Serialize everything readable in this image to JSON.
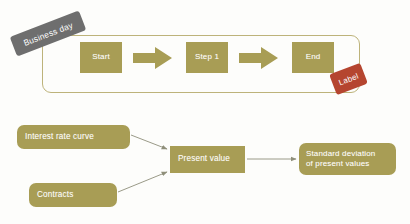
{
  "diagram": {
    "colors": {
      "node_fill": "#a89d55",
      "loop_border": "#bdb37a",
      "business_day_tag": "#6e6e6e",
      "label_tag": "#b5452f",
      "connector": "#8f8f7a",
      "node_text": "#ffffff",
      "background": "#fdfdfb"
    },
    "top_flow": {
      "container_tag": "Business day",
      "end_tag": "Label",
      "steps": [
        {
          "id": "start",
          "label": "Start"
        },
        {
          "id": "step1",
          "label": "Step 1"
        },
        {
          "id": "end",
          "label": "End"
        }
      ],
      "arrows": [
        {
          "from": "start",
          "to": "step1",
          "style": "block-chevron"
        },
        {
          "from": "step1",
          "to": "end",
          "style": "block-chevron"
        }
      ]
    },
    "bottom_flow": {
      "nodes": [
        {
          "id": "interest-rate-curve",
          "label": "Interest rate curve",
          "shape": "rounded"
        },
        {
          "id": "contracts",
          "label": "Contracts",
          "shape": "rounded"
        },
        {
          "id": "present-value",
          "label": "Present value",
          "shape": "rectangle"
        },
        {
          "id": "std-dev",
          "label": "Standard deviation\nof present values",
          "shape": "rounded"
        }
      ],
      "arrows": [
        {
          "from": "interest-rate-curve",
          "to": "present-value",
          "style": "thin-line"
        },
        {
          "from": "contracts",
          "to": "present-value",
          "style": "thin-line"
        },
        {
          "from": "present-value",
          "to": "std-dev",
          "style": "thin-line"
        }
      ]
    }
  }
}
